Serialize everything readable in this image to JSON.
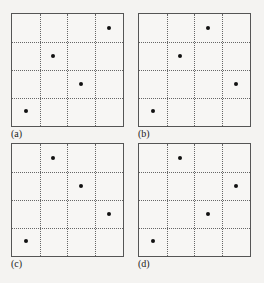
{
  "grid": {
    "rows": 4,
    "cols": 4
  },
  "panels": [
    {
      "label": "(a)",
      "x": 11,
      "y": 13,
      "w": 113,
      "h": 114,
      "points": [
        [
          3,
          0
        ],
        [
          1,
          1
        ],
        [
          2,
          2
        ],
        [
          0,
          3
        ]
      ]
    },
    {
      "label": "(b)",
      "x": 138,
      "y": 13,
      "w": 113,
      "h": 114,
      "points": [
        [
          2,
          0
        ],
        [
          1,
          1
        ],
        [
          3,
          2
        ],
        [
          0,
          3
        ]
      ]
    },
    {
      "label": "(c)",
      "x": 11,
      "y": 143,
      "w": 113,
      "h": 114,
      "points": [
        [
          1,
          0
        ],
        [
          2,
          1
        ],
        [
          3,
          2
        ],
        [
          0,
          3
        ]
      ]
    },
    {
      "label": "(d)",
      "x": 138,
      "y": 143,
      "w": 113,
      "h": 114,
      "points": [
        [
          1,
          0
        ],
        [
          3,
          1
        ],
        [
          2,
          2
        ],
        [
          0,
          3
        ]
      ]
    }
  ]
}
